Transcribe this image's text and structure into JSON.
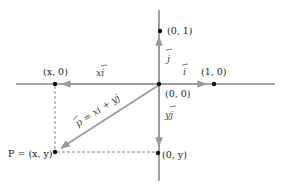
{
  "diagram": {
    "type": "vector-decomposition",
    "colors": {
      "axis": "#555555",
      "vector": "#9a9a9a",
      "point": "#111111",
      "dashed": "#777777",
      "text": "#1a1a1a"
    },
    "points": {
      "origin": {
        "label": "(0, 0)"
      },
      "unit_y": {
        "label": "(0, 1)"
      },
      "unit_x": {
        "label": "(1, 0)"
      },
      "x_proj": {
        "label": "(x, 0)"
      },
      "y_proj": {
        "label": "(0, y)"
      },
      "p": {
        "label": "P = (x, y)"
      }
    },
    "vectors": {
      "i": {
        "label": "i"
      },
      "j": {
        "label": "j"
      },
      "xi": {
        "label": "xi"
      },
      "yj": {
        "label": "yj"
      },
      "p": {
        "label": "p = xi + yj"
      }
    }
  }
}
